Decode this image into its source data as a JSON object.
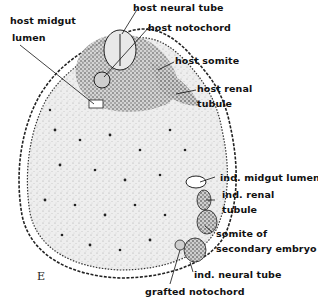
{
  "figure": {
    "panel_letter": "E",
    "labels": {
      "host_midgut_lumen_1": "host midgut",
      "host_midgut_lumen_2": "lumen",
      "host_neural_tube": "host neural tube",
      "host_notochord": "host notochord",
      "host_somite": "host somite",
      "host_renal_tubule_1": "host renal",
      "host_renal_tubule_2": "tubule",
      "ind_midgut_lumen": "ind. midgut lumen",
      "ind_renal_tubule_1": "ind. renal",
      "ind_renal_tubule_2": "tubule",
      "somite_secondary_1": "somite of",
      "somite_secondary_2": "secondary embryo",
      "ind_neural_tube": "ind. neural tube",
      "grafted_notochord": "grafted notochord"
    },
    "colors": {
      "ink": "#111111",
      "tissue_fill": "#e6e6e6",
      "background": "#ffffff"
    }
  }
}
